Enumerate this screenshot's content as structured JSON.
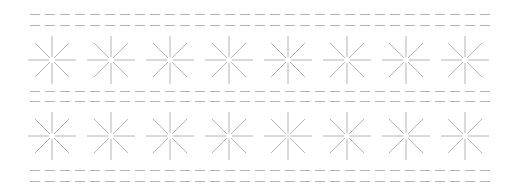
{
  "canvas": {
    "width": 512,
    "height": 192,
    "background": "#ffffff"
  },
  "style": {
    "stroke": "#b4b4b4",
    "dash": "10 5"
  },
  "dashed_lines": [
    {
      "y": 14,
      "x1": 30,
      "x2": 490
    },
    {
      "y": 25,
      "x1": 30,
      "x2": 490
    },
    {
      "y": 91,
      "x1": 30,
      "x2": 490
    },
    {
      "y": 101,
      "x1": 30,
      "x2": 490
    },
    {
      "y": 170,
      "x1": 30,
      "x2": 490
    },
    {
      "y": 181,
      "x1": 30,
      "x2": 490
    }
  ],
  "starbursts": {
    "rows": [
      60,
      136
    ],
    "columns": [
      52,
      111,
      170,
      229,
      288,
      347,
      406,
      465
    ],
    "axis_length": 24,
    "diag_length": 17
  }
}
